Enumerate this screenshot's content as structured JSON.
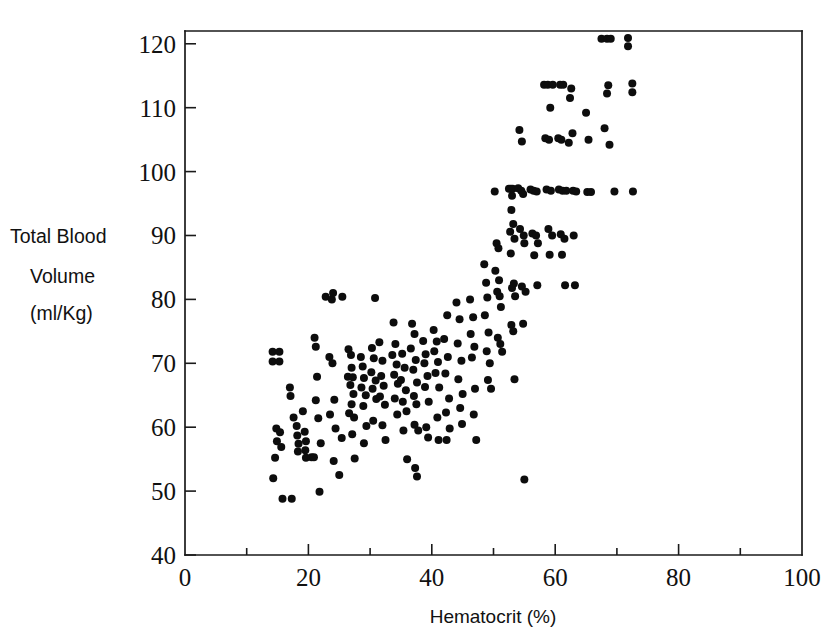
{
  "chart_data": {
    "type": "scatter",
    "title": "",
    "xlabel": "Hematocrit (%)",
    "ylabel": "Total Blood Volume (ml/Kg)",
    "ylabel_lines": [
      "Total Blood",
      "Volume",
      "(ml/Kg)"
    ],
    "xlim": [
      0,
      100
    ],
    "ylim": [
      40,
      122
    ],
    "xticks": [
      0,
      20,
      40,
      60,
      80,
      100
    ],
    "xtick_labels": [
      "0",
      "20",
      "40",
      "60",
      "80",
      "100"
    ],
    "xminorticks": [
      10,
      30,
      50,
      70,
      90
    ],
    "yticks": [
      40,
      50,
      60,
      70,
      80,
      90,
      100,
      110,
      120
    ],
    "ytick_labels": [
      "40",
      "50",
      "60",
      "70",
      "80",
      "90",
      "100",
      "110",
      "120"
    ],
    "grid": false,
    "legend": false,
    "marker": "filled-circle",
    "marker_color": "#0d0d0d",
    "marker_size_px": 5.2,
    "n_points": 203,
    "points": [
      [
        14.2,
        71.8
      ],
      [
        15.3,
        71.8
      ],
      [
        14.2,
        70.3
      ],
      [
        15.3,
        70.3
      ],
      [
        14.8,
        59.8
      ],
      [
        15.4,
        59.2
      ],
      [
        14.9,
        57.8
      ],
      [
        15.6,
        56.9
      ],
      [
        14.6,
        55.2
      ],
      [
        14.3,
        52.0
      ],
      [
        15.8,
        48.8
      ],
      [
        17.3,
        48.8
      ],
      [
        17.0,
        66.2
      ],
      [
        17.1,
        64.9
      ],
      [
        17.6,
        61.5
      ],
      [
        18.1,
        60.2
      ],
      [
        18.2,
        58.7
      ],
      [
        18.4,
        57.4
      ],
      [
        18.3,
        56.2
      ],
      [
        19.1,
        62.5
      ],
      [
        19.4,
        59.3
      ],
      [
        19.6,
        57.8
      ],
      [
        19.5,
        56.4
      ],
      [
        19.6,
        55.2
      ],
      [
        20.5,
        55.3
      ],
      [
        20.9,
        55.3
      ],
      [
        21.0,
        74.0
      ],
      [
        21.2,
        72.6
      ],
      [
        21.4,
        67.9
      ],
      [
        21.2,
        64.2
      ],
      [
        21.6,
        61.4
      ],
      [
        22.0,
        57.5
      ],
      [
        21.8,
        49.9
      ],
      [
        22.8,
        80.4
      ],
      [
        23.8,
        80.0
      ],
      [
        24.0,
        81.0
      ],
      [
        25.5,
        80.4
      ],
      [
        23.4,
        71.0
      ],
      [
        23.9,
        70.0
      ],
      [
        24.2,
        64.3
      ],
      [
        23.5,
        62.0
      ],
      [
        24.4,
        59.8
      ],
      [
        24.1,
        54.7
      ],
      [
        25.4,
        58.3
      ],
      [
        25.0,
        52.5
      ],
      [
        26.5,
        72.2
      ],
      [
        26.9,
        71.3
      ],
      [
        27.0,
        69.3
      ],
      [
        26.4,
        67.9
      ],
      [
        27.2,
        67.8
      ],
      [
        26.8,
        66.6
      ],
      [
        27.3,
        65.2
      ],
      [
        27.0,
        63.6
      ],
      [
        26.6,
        62.2
      ],
      [
        27.4,
        61.5
      ],
      [
        27.1,
        58.9
      ],
      [
        27.5,
        55.1
      ],
      [
        28.5,
        71.0
      ],
      [
        28.8,
        69.5
      ],
      [
        29.0,
        67.7
      ],
      [
        28.6,
        66.2
      ],
      [
        29.3,
        65.0
      ],
      [
        28.9,
        63.3
      ],
      [
        29.4,
        60.2
      ],
      [
        29.0,
        57.5
      ],
      [
        30.8,
        80.2
      ],
      [
        30.3,
        72.4
      ],
      [
        30.6,
        70.8
      ],
      [
        30.2,
        68.6
      ],
      [
        30.9,
        67.3
      ],
      [
        30.4,
        66.0
      ],
      [
        31.0,
        64.4
      ],
      [
        30.5,
        61.0
      ],
      [
        31.5,
        73.3
      ],
      [
        32.0,
        70.4
      ],
      [
        31.8,
        68.0
      ],
      [
        32.2,
        66.5
      ],
      [
        31.6,
        64.8
      ],
      [
        32.4,
        63.5
      ],
      [
        32.0,
        60.3
      ],
      [
        32.5,
        58.0
      ],
      [
        33.8,
        76.4
      ],
      [
        34.1,
        73.0
      ],
      [
        33.6,
        71.3
      ],
      [
        34.3,
        69.8
      ],
      [
        33.9,
        68.2
      ],
      [
        34.5,
        66.8
      ],
      [
        34.0,
        64.5
      ],
      [
        34.4,
        62.0
      ],
      [
        35.2,
        71.5
      ],
      [
        35.6,
        69.3
      ],
      [
        35.0,
        67.4
      ],
      [
        35.8,
        65.8
      ],
      [
        35.3,
        64.0
      ],
      [
        35.9,
        62.5
      ],
      [
        35.4,
        59.5
      ],
      [
        36.0,
        55.0
      ],
      [
        36.8,
        76.2
      ],
      [
        37.2,
        74.6
      ],
      [
        36.6,
        72.3
      ],
      [
        37.4,
        70.5
      ],
      [
        37.0,
        69.0
      ],
      [
        37.6,
        67.0
      ],
      [
        37.1,
        64.9
      ],
      [
        37.5,
        63.6
      ],
      [
        37.2,
        60.4
      ],
      [
        37.8,
        59.5
      ],
      [
        37.3,
        53.6
      ],
      [
        37.6,
        52.3
      ],
      [
        38.6,
        73.5
      ],
      [
        39.0,
        71.4
      ],
      [
        38.8,
        70.0
      ],
      [
        39.3,
        68.0
      ],
      [
        38.9,
        66.3
      ],
      [
        39.5,
        64.0
      ],
      [
        39.1,
        60.0
      ],
      [
        39.4,
        58.4
      ],
      [
        40.3,
        75.2
      ],
      [
        40.8,
        73.4
      ],
      [
        40.4,
        71.9
      ],
      [
        41.0,
        70.2
      ],
      [
        40.6,
        68.5
      ],
      [
        41.2,
        66.2
      ],
      [
        40.9,
        61.5
      ],
      [
        41.1,
        58.0
      ],
      [
        42.5,
        77.5
      ],
      [
        42.0,
        73.8
      ],
      [
        42.6,
        71.0
      ],
      [
        42.2,
        68.4
      ],
      [
        42.8,
        64.5
      ],
      [
        42.3,
        62.3
      ],
      [
        42.9,
        59.8
      ],
      [
        42.4,
        58.0
      ],
      [
        44.0,
        79.5
      ],
      [
        44.5,
        76.9
      ],
      [
        44.2,
        73.1
      ],
      [
        44.8,
        70.4
      ],
      [
        44.3,
        67.5
      ],
      [
        45.0,
        65.2
      ],
      [
        44.6,
        63.0
      ],
      [
        44.9,
        60.5
      ],
      [
        46.2,
        80.0
      ],
      [
        46.7,
        77.2
      ],
      [
        46.3,
        74.6
      ],
      [
        46.9,
        72.6
      ],
      [
        46.5,
        70.9
      ],
      [
        47.0,
        66.0
      ],
      [
        46.8,
        62.0
      ],
      [
        47.2,
        58.0
      ],
      [
        48.5,
        85.5
      ],
      [
        48.8,
        82.6
      ],
      [
        49.0,
        80.3
      ],
      [
        48.6,
        77.5
      ],
      [
        49.2,
        74.8
      ],
      [
        48.9,
        71.9
      ],
      [
        49.4,
        70.0
      ],
      [
        49.1,
        67.4
      ],
      [
        49.6,
        66.0
      ],
      [
        50.2,
        96.9
      ],
      [
        50.5,
        88.8
      ],
      [
        50.8,
        88.0
      ],
      [
        50.3,
        84.5
      ],
      [
        50.9,
        83.0
      ],
      [
        50.6,
        81.2
      ],
      [
        51.0,
        80.5
      ],
      [
        51.2,
        78.8
      ],
      [
        50.7,
        74.0
      ],
      [
        51.1,
        73.0
      ],
      [
        51.4,
        71.8
      ],
      [
        52.5,
        97.3
      ],
      [
        52.8,
        97.3
      ],
      [
        53.1,
        97.3
      ],
      [
        53.0,
        96.2
      ],
      [
        52.9,
        94.0
      ],
      [
        53.2,
        91.8
      ],
      [
        52.7,
        90.6
      ],
      [
        53.4,
        89.5
      ],
      [
        52.8,
        87.2
      ],
      [
        53.3,
        82.5
      ],
      [
        53.0,
        81.8
      ],
      [
        53.5,
        80.5
      ],
      [
        52.9,
        76.0
      ],
      [
        53.2,
        75.0
      ],
      [
        53.4,
        67.5
      ],
      [
        54.2,
        106.5
      ],
      [
        54.6,
        104.7
      ],
      [
        54.0,
        97.4
      ],
      [
        54.5,
        97.0
      ],
      [
        54.8,
        96.5
      ],
      [
        54.3,
        91.0
      ],
      [
        54.9,
        90.0
      ],
      [
        55.0,
        88.8
      ],
      [
        54.6,
        82.0
      ],
      [
        55.2,
        81.2
      ],
      [
        54.8,
        76.2
      ],
      [
        55.0,
        51.8
      ],
      [
        56.0,
        97.2
      ],
      [
        56.5,
        97.0
      ],
      [
        57.0,
        96.9
      ],
      [
        56.3,
        90.3
      ],
      [
        56.9,
        90.0
      ],
      [
        57.2,
        88.8
      ],
      [
        56.6,
        86.9
      ],
      [
        57.1,
        82.2
      ],
      [
        58.2,
        113.6
      ],
      [
        58.8,
        113.6
      ],
      [
        59.6,
        113.6
      ],
      [
        59.2,
        110.0
      ],
      [
        58.4,
        105.2
      ],
      [
        59.0,
        105.0
      ],
      [
        58.6,
        97.2
      ],
      [
        59.3,
        97.0
      ],
      [
        58.9,
        91.0
      ],
      [
        59.5,
        90.0
      ],
      [
        59.1,
        87.0
      ],
      [
        60.8,
        113.6
      ],
      [
        61.3,
        113.6
      ],
      [
        60.5,
        105.2
      ],
      [
        61.0,
        105.0
      ],
      [
        60.6,
        97.2
      ],
      [
        61.2,
        97.0
      ],
      [
        61.8,
        97.0
      ],
      [
        60.9,
        90.2
      ],
      [
        61.5,
        89.5
      ],
      [
        61.1,
        87.0
      ],
      [
        61.6,
        82.2
      ],
      [
        62.6,
        113.0
      ],
      [
        62.4,
        111.5
      ],
      [
        62.8,
        106.0
      ],
      [
        62.2,
        104.5
      ],
      [
        62.9,
        97.0
      ],
      [
        63.4,
        96.9
      ],
      [
        63.0,
        90.0
      ],
      [
        63.2,
        82.2
      ],
      [
        65.0,
        109.2
      ],
      [
        65.4,
        105.0
      ],
      [
        65.2,
        96.8
      ],
      [
        65.8,
        96.8
      ],
      [
        67.5,
        120.8
      ],
      [
        68.4,
        120.8
      ],
      [
        69.0,
        120.8
      ],
      [
        68.6,
        113.5
      ],
      [
        68.4,
        112.2
      ],
      [
        68.0,
        106.8
      ],
      [
        68.8,
        104.2
      ],
      [
        69.6,
        96.9
      ],
      [
        71.8,
        120.9
      ],
      [
        71.8,
        119.6
      ],
      [
        72.5,
        113.8
      ],
      [
        72.5,
        112.4
      ],
      [
        72.6,
        96.9
      ]
    ]
  },
  "figure": {
    "background": "#ffffff",
    "axis_color": "#1a1a1a",
    "point_color": "#0d0d0d"
  }
}
